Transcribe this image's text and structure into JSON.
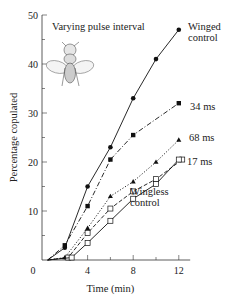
{
  "chart_data": {
    "type": "line",
    "title": "Varying pulse interval",
    "xlabel": "Time (min)",
    "ylabel": "Percentage copulated",
    "xlim": [
      0,
      13
    ],
    "ylim": [
      0,
      50
    ],
    "x_ticks": [
      0,
      4,
      8,
      12
    ],
    "y_ticks": [
      10,
      20,
      30,
      40,
      50
    ],
    "grid": false,
    "legend_position": "inline labels at line ends",
    "series": [
      {
        "name": "Winged control",
        "label_lines": [
          "Winged",
          "control"
        ],
        "marker": "filled-circle",
        "line": "solid",
        "x": [
          0.5,
          2,
          4,
          6,
          8,
          10,
          12
        ],
        "y": [
          0,
          2.5,
          15,
          23,
          33,
          41,
          47
        ]
      },
      {
        "name": "34 ms",
        "label_lines": [
          "34 ms"
        ],
        "marker": "filled-square",
        "line": "dash-dot",
        "x": [
          0.5,
          2,
          4,
          6,
          8,
          12
        ],
        "y": [
          0,
          3,
          11,
          20.5,
          25.5,
          32
        ]
      },
      {
        "name": "68 ms",
        "label_lines": [
          "68 ms"
        ],
        "marker": "filled-triangle",
        "line": "dotted",
        "x": [
          0.5,
          2,
          4,
          6,
          8,
          10,
          12
        ],
        "y": [
          0,
          0.5,
          6.5,
          13,
          16,
          20,
          24.5
        ]
      },
      {
        "name": "17 ms",
        "label_lines": [
          "17 ms"
        ],
        "marker": "open-square",
        "line": "dashed",
        "x": [
          0.5,
          2.3,
          4,
          6,
          8,
          10,
          12.3
        ],
        "y": [
          0,
          0.5,
          5.5,
          10.5,
          14,
          16.5,
          20.5
        ]
      },
      {
        "name": "Wingless control",
        "label_lines": [
          "Wingless",
          "control"
        ],
        "marker": "open-square",
        "line": "solid",
        "x": [
          0.5,
          2.6,
          4,
          6,
          8,
          10,
          12
        ],
        "y": [
          0,
          0.5,
          3.5,
          8,
          12.5,
          15.5,
          20.5
        ]
      }
    ],
    "annotations": [
      "fly illustration near title"
    ]
  }
}
